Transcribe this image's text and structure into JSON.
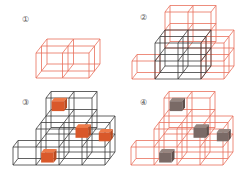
{
  "colors": {
    "red_frame": "#e8705c",
    "black_frame": "#3a3a3a",
    "orange_cube": "#d9582a",
    "orange_cube_top": "#ee7a48",
    "orange_cube_side": "#b84a20",
    "gray_cube": "#7a6a66",
    "gray_cube_top": "#968680",
    "gray_cube_side": "#5e504c"
  },
  "panels": [
    {
      "id": "panel-1",
      "label": "①",
      "label_pos": [
        22,
        22
      ],
      "origin": [
        36,
        78
      ],
      "unit": {
        "w": 26.5,
        "h": 25,
        "dx": 5.5,
        "dy": -7
      },
      "frames": [
        {
          "color": "red",
          "cells": [
            [
              0,
              0,
              0
            ],
            [
              1,
              0,
              0
            ],
            [
              0,
              0,
              1
            ],
            [
              1,
              0,
              1
            ]
          ]
        }
      ],
      "solids": []
    },
    {
      "id": "panel-2",
      "label": "②",
      "label_pos": [
        140,
        20
      ],
      "origin": [
        132,
        79
      ],
      "unit": {
        "w": 23,
        "h": 18,
        "dx": 5,
        "dy": -6.5
      },
      "frames": [
        {
          "color": "red",
          "cells": [
            [
              0,
              0,
              0
            ],
            [
              1,
              2,
              2
            ],
            [
              2,
              2,
              2
            ],
            [
              1,
              1,
              2
            ],
            [
              2,
              1,
              2
            ],
            [
              3,
              0,
              0
            ],
            [
              3,
              1,
              0
            ],
            [
              3,
              0,
              1
            ],
            [
              3,
              1,
              1
            ]
          ]
        },
        {
          "color": "black",
          "cells": [
            [
              1,
              0,
              0
            ],
            [
              2,
              0,
              0
            ],
            [
              1,
              1,
              0
            ],
            [
              2,
              1,
              0
            ],
            [
              1,
              0,
              1
            ],
            [
              2,
              0,
              1
            ],
            [
              1,
              1,
              1
            ],
            [
              2,
              1,
              1
            ]
          ]
        }
      ],
      "solids": []
    },
    {
      "id": "panel-3",
      "label": "③",
      "label_pos": [
        22,
        105
      ],
      "origin": [
        13,
        165
      ],
      "unit": {
        "w": 23,
        "h": 18,
        "dx": 5,
        "dy": -6.5
      },
      "frames": [
        {
          "color": "black",
          "cells": [
            [
              0,
              0,
              0
            ],
            [
              1,
              0,
              0
            ],
            [
              2,
              0,
              0
            ],
            [
              1,
              1,
              0
            ],
            [
              2,
              1,
              0
            ],
            [
              1,
              0,
              1
            ],
            [
              2,
              0,
              1
            ],
            [
              1,
              1,
              1
            ],
            [
              2,
              1,
              1
            ],
            [
              1,
              2,
              2
            ],
            [
              2,
              2,
              2
            ],
            [
              1,
              1,
              2
            ],
            [
              2,
              1,
              2
            ],
            [
              3,
              0,
              0
            ],
            [
              3,
              1,
              0
            ],
            [
              3,
              0,
              1
            ],
            [
              3,
              1,
              1
            ]
          ]
        }
      ],
      "solids": [
        {
          "color": "orange",
          "pos": [
            1.2,
            2.2,
            2.2
          ],
          "size": 0.55
        },
        {
          "color": "orange",
          "pos": [
            2.5,
            1.15,
            1.0
          ],
          "size": 0.55
        },
        {
          "color": "orange",
          "pos": [
            3.6,
            1.1,
            0.6
          ],
          "size": 0.5
        },
        {
          "color": "orange",
          "pos": [
            1.2,
            0.1,
            0.1
          ],
          "size": 0.55
        }
      ]
    },
    {
      "id": "panel-4",
      "label": "④",
      "label_pos": [
        140,
        105
      ],
      "origin": [
        131,
        165
      ],
      "unit": {
        "w": 23,
        "h": 18,
        "dx": 5,
        "dy": -6.5
      },
      "frames": [
        {
          "color": "red",
          "cells": [
            [
              0,
              0,
              0
            ],
            [
              1,
              0,
              0
            ],
            [
              2,
              0,
              0
            ],
            [
              1,
              1,
              0
            ],
            [
              2,
              1,
              0
            ],
            [
              1,
              0,
              1
            ],
            [
              2,
              0,
              1
            ],
            [
              1,
              1,
              1
            ],
            [
              2,
              1,
              1
            ],
            [
              1,
              2,
              2
            ],
            [
              2,
              2,
              2
            ],
            [
              1,
              1,
              2
            ],
            [
              2,
              1,
              2
            ],
            [
              3,
              0,
              0
            ],
            [
              3,
              1,
              0
            ],
            [
              3,
              0,
              1
            ],
            [
              3,
              1,
              1
            ]
          ]
        }
      ],
      "solids": [
        {
          "color": "gray",
          "pos": [
            1.2,
            2.2,
            2.2
          ],
          "size": 0.55
        },
        {
          "color": "gray",
          "pos": [
            2.5,
            1.15,
            1.0
          ],
          "size": 0.55
        },
        {
          "color": "gray",
          "pos": [
            3.6,
            1.1,
            0.6
          ],
          "size": 0.5
        },
        {
          "color": "gray",
          "pos": [
            1.2,
            0.1,
            0.1
          ],
          "size": 0.55
        }
      ]
    }
  ]
}
